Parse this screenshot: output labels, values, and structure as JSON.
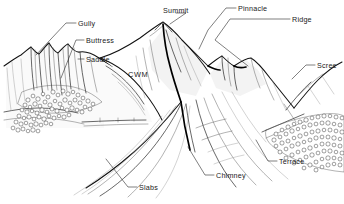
{
  "diagram": {
    "style": "pen-and-ink line drawing",
    "background_color": "#ffffff",
    "ink_color": "#111111",
    "labels": [
      {
        "id": "gully",
        "text": "Gully",
        "x": 78,
        "y": 26,
        "anchor": "start"
      },
      {
        "id": "buttress",
        "text": "Buttress",
        "x": 86,
        "y": 43,
        "anchor": "start"
      },
      {
        "id": "saddle",
        "text": "Saddle",
        "x": 86,
        "y": 62,
        "anchor": "start"
      },
      {
        "id": "summit",
        "text": "Summit",
        "x": 163,
        "y": 13,
        "anchor": "start"
      },
      {
        "id": "pinnacle",
        "text": "Pinnacle",
        "x": 238,
        "y": 11,
        "anchor": "start"
      },
      {
        "id": "ridge",
        "text": "Ridge",
        "x": 292,
        "y": 22,
        "anchor": "start"
      },
      {
        "id": "scree",
        "text": "Scree",
        "x": 317,
        "y": 68,
        "anchor": "start"
      },
      {
        "id": "cwm",
        "text": "CWM",
        "x": 128,
        "y": 77,
        "anchor": "start"
      },
      {
        "id": "slabs",
        "text": "Slabs",
        "x": 139,
        "y": 190,
        "anchor": "start"
      },
      {
        "id": "chimney",
        "text": "Chimney",
        "x": 216,
        "y": 178,
        "anchor": "start"
      },
      {
        "id": "terrace",
        "text": "Terrace",
        "x": 279,
        "y": 164,
        "anchor": "start"
      }
    ]
  }
}
